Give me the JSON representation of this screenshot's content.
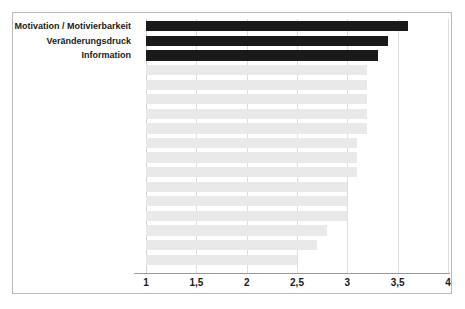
{
  "chart_data": {
    "type": "bar",
    "orientation": "horizontal",
    "title": "",
    "subtitle": "",
    "xlabel": "",
    "ylabel": "",
    "xlim": [
      1,
      4
    ],
    "ylim": null,
    "grid": true,
    "legend": null,
    "legend_position": "none",
    "xticks": [
      "1",
      "1,5",
      "2",
      "2,5",
      "3",
      "3,5",
      "4"
    ],
    "xtick_values": [
      1,
      1.5,
      2,
      2.5,
      3,
      3.5,
      4
    ],
    "categories": [
      "Motivation / Motivierbarkeit",
      "Veränderungsdruck",
      "Information",
      "",
      "",
      "",
      "",
      "",
      "",
      "",
      "",
      "",
      "",
      "",
      "",
      "",
      ""
    ],
    "values": [
      3.6,
      3.4,
      3.3,
      3.2,
      3.2,
      3.2,
      3.2,
      3.2,
      3.1,
      3.1,
      3.1,
      3.0,
      3.0,
      3.0,
      2.8,
      2.7,
      2.5
    ],
    "highlighted": [
      true,
      true,
      true,
      false,
      false,
      false,
      false,
      false,
      false,
      false,
      false,
      false,
      false,
      false,
      false,
      false,
      false
    ],
    "colors": {
      "highlight_bar": "#1a1a1a",
      "normal_bar": "#e9e9e9",
      "gridline": "#dddddd",
      "axis": "#9a9a9a",
      "frame": "#b9b9b9",
      "text": "#1a1a1a",
      "background": "#ffffff"
    }
  }
}
